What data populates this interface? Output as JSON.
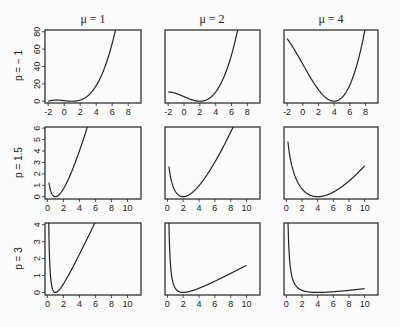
{
  "chart_data": {
    "type": "line",
    "title": "",
    "layout": "3x3 grid of panels",
    "column_titles": [
      "μ = 1",
      "μ = 2",
      "μ = 4"
    ],
    "row_labels": [
      "p = − 1",
      "p = 1.5",
      "p = 3"
    ],
    "rows": [
      {
        "p": -1,
        "xlim": [
          -2.4,
          9.6
        ],
        "ylim": [
          -2,
          82
        ],
        "xticks": [
          -2,
          0,
          2,
          4,
          6,
          8
        ],
        "yticks": [
          0,
          20,
          40,
          60,
          80
        ],
        "x_range": [
          -2,
          10
        ]
      },
      {
        "p": 1.5,
        "xlim": [
          -0.3,
          11.7
        ],
        "ylim": [
          -0.2,
          6.1
        ],
        "xticks": [
          0,
          2,
          4,
          6,
          8,
          10
        ],
        "yticks": [
          0,
          1,
          2,
          3,
          4,
          5,
          6
        ],
        "x_range": [
          0.2,
          10
        ]
      },
      {
        "p": 3,
        "xlim": [
          -0.3,
          11.7
        ],
        "ylim": [
          -0.15,
          4.1
        ],
        "xticks": [
          0,
          2,
          4,
          6,
          8,
          10
        ],
        "yticks": [
          0,
          1,
          2,
          3,
          4
        ],
        "x_range": [
          0.05,
          10
        ]
      }
    ],
    "columns": [
      {
        "mu": 1
      },
      {
        "mu": 2
      },
      {
        "mu": 4
      }
    ],
    "series_description": "Unit deviance d(y, μ) for power variance p, plotted vs y",
    "approx_points": {
      "p=-1,mu=1": [
        [
          -2,
          3
        ],
        [
          0,
          0.7
        ],
        [
          1,
          0
        ],
        [
          2,
          1.3
        ],
        [
          4,
          18
        ],
        [
          6,
          62
        ],
        [
          6.4,
          80
        ]
      ],
      "p=-1,mu=2": [
        [
          -2,
          13
        ],
        [
          0,
          5.3
        ],
        [
          2,
          0
        ],
        [
          4,
          10.7
        ],
        [
          6,
          47
        ],
        [
          6.9,
          80
        ]
      ],
      "p=-1,mu=4": [
        [
          -2,
          72
        ],
        [
          0,
          42.7
        ],
        [
          2,
          13.3
        ],
        [
          4,
          0
        ],
        [
          6,
          10.7
        ],
        [
          8,
          64
        ],
        [
          8.3,
          80
        ]
      ],
      "p=1.5,mu=1": [
        [
          0.2,
          1.9
        ],
        [
          1,
          0
        ],
        [
          2,
          0.69
        ],
        [
          3,
          2.1
        ],
        [
          4,
          4
        ],
        [
          5.1,
          6
        ]
      ],
      "p=1.5,mu=2": [
        [
          0.2,
          3.4
        ],
        [
          1,
          0.69
        ],
        [
          2,
          0
        ],
        [
          4,
          0.98
        ],
        [
          6,
          2.5
        ],
        [
          8.6,
          6
        ]
      ],
      "p=1.5,mu=4": [
        [
          0.2,
          5.7
        ],
        [
          1,
          2.0
        ],
        [
          2,
          0.69
        ],
        [
          4,
          0
        ],
        [
          6,
          0.42
        ],
        [
          8,
          1.37
        ],
        [
          10,
          2.5
        ]
      ],
      "p=3,mu=1": [
        [
          0.1,
          8.1
        ],
        [
          0.3,
          1.63
        ],
        [
          1,
          0
        ],
        [
          2,
          0.5
        ],
        [
          4,
          2.25
        ],
        [
          6,
          4.17
        ]
      ],
      "p=3,mu=2": [
        [
          0.1,
          9.03
        ],
        [
          0.5,
          1.13
        ],
        [
          1,
          0.25
        ],
        [
          2,
          0
        ],
        [
          4,
          0.13
        ],
        [
          6,
          0.44
        ],
        [
          10,
          1.6
        ]
      ],
      "p=3,mu=4": [
        [
          0.1,
          9.5
        ],
        [
          0.5,
          1.53
        ],
        [
          1,
          0.56
        ],
        [
          2,
          0.13
        ],
        [
          4,
          0
        ],
        [
          6,
          0.03
        ],
        [
          10,
          0.23
        ]
      ]
    },
    "grid": false,
    "legend": "none",
    "line_color": "#222222",
    "xlabel": "",
    "ylabel": ""
  }
}
